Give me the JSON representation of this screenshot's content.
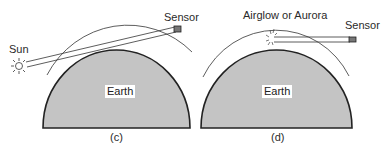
{
  "panels": [
    {
      "id": "c",
      "caption": "(c)",
      "earth_label": "Earth",
      "sun_label": "Sun",
      "sensor_label": "Sensor"
    },
    {
      "id": "d",
      "caption": "(d)",
      "earth_label": "Earth",
      "emission_label": "Airglow or Aurora",
      "sensor_label": "Sensor"
    }
  ],
  "colors": {
    "earth_fill": "#c4c4c4",
    "outline": "#2a2a2a",
    "background": "#ffffff"
  }
}
